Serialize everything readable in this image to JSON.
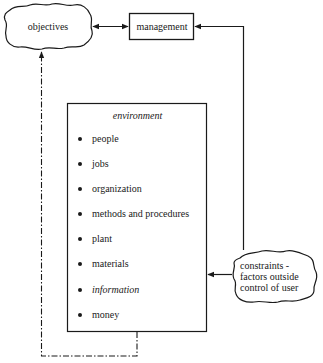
{
  "diagram": {
    "nodes": {
      "objectives": {
        "label": "objectives",
        "shape": "cloud"
      },
      "management": {
        "label": "management",
        "shape": "box"
      },
      "environment": {
        "title": "environment",
        "shape": "box",
        "items": [
          {
            "label": "people",
            "italic": false
          },
          {
            "label": "jobs",
            "italic": false
          },
          {
            "label": "organization",
            "italic": false
          },
          {
            "label": "methods and procedures",
            "italic": false
          },
          {
            "label": "plant",
            "italic": false
          },
          {
            "label": "materials",
            "italic": false
          },
          {
            "label": "information",
            "italic": true
          },
          {
            "label": "money",
            "italic": false
          }
        ]
      },
      "constraints": {
        "label_lines": [
          "constraints -",
          "factors outside",
          "control of user"
        ],
        "shape": "cloud"
      }
    },
    "edges": [
      {
        "from": "objectives",
        "to": "management",
        "style": "solid",
        "direction": "both"
      },
      {
        "from": "constraints",
        "to": "management",
        "style": "solid",
        "direction": "forward"
      },
      {
        "from": "constraints",
        "to": "environment",
        "style": "solid",
        "direction": "forward"
      },
      {
        "from": "environment",
        "to": "objectives",
        "style": "dash-dot",
        "direction": "forward"
      }
    ],
    "colors": {
      "ink": "#1a1a1a",
      "background": "#ffffff"
    }
  }
}
